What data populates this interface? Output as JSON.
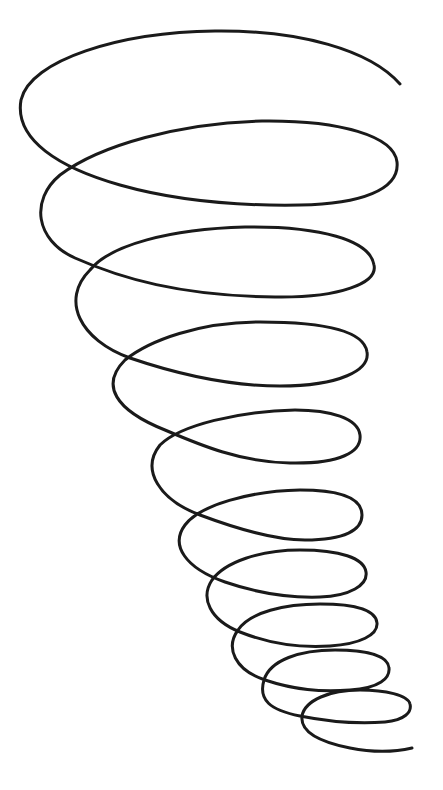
{
  "image": {
    "subject": "tornado-shaped spiral line drawing",
    "background_color": "#ffffff",
    "stroke_color": "#1a1a1a",
    "stroke_width": 3,
    "loop_count": 10
  }
}
